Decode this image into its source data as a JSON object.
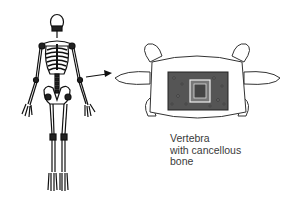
{
  "figure": {
    "left_panel": {
      "subject": "full human skeleton (anterior view)"
    },
    "connector": {
      "type": "arrow",
      "from": "lumbar spine",
      "to": "vertebra"
    },
    "right_panel": {
      "subject": "vertebra with cut-away showing cancellous bone"
    },
    "label": {
      "line1": "Vertebra",
      "line2": "with cancellous",
      "line3": "bone"
    }
  }
}
